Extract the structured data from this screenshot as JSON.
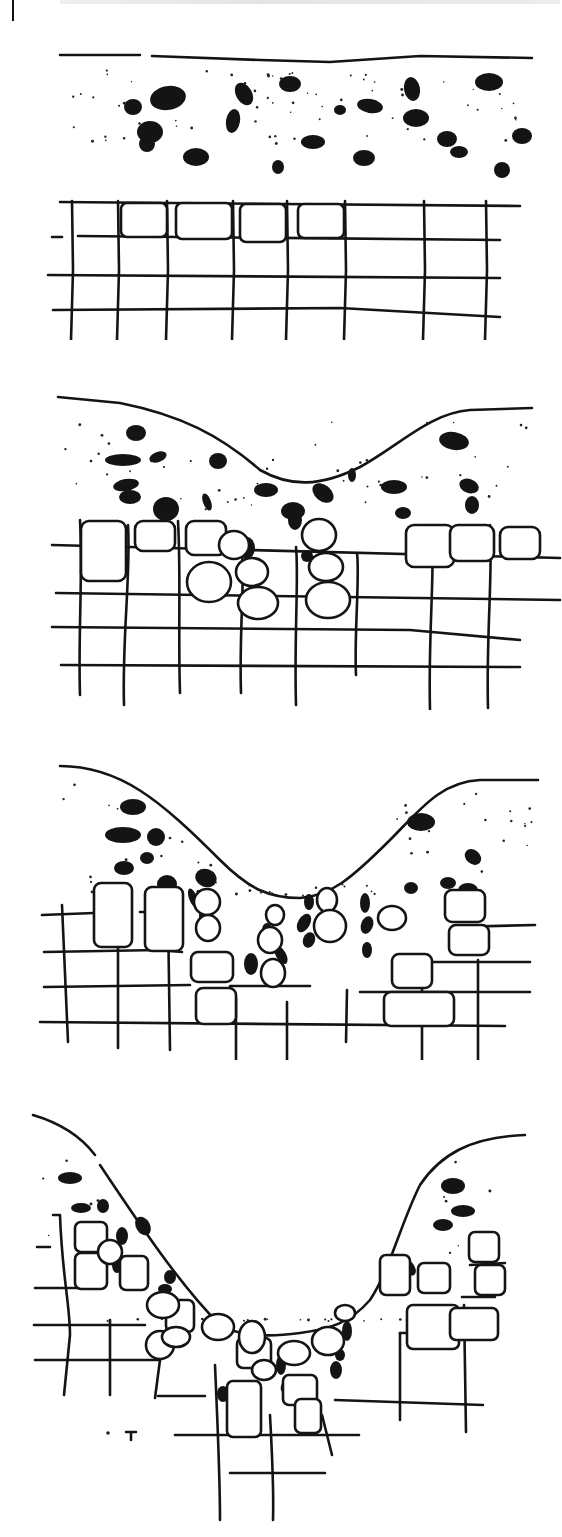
{
  "figure": {
    "cut_off_header_text": "",
    "stroke_color": "#141414",
    "background_color": "#ffffff",
    "panels": [
      {
        "id": "stage-1",
        "stage": 1,
        "label": ""
      },
      {
        "id": "stage-2",
        "stage": 2,
        "label": ""
      },
      {
        "id": "stage-3",
        "stage": 3,
        "label": ""
      },
      {
        "id": "stage-4",
        "stage": 4,
        "label": ""
      }
    ]
  }
}
